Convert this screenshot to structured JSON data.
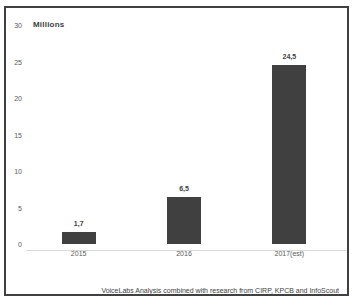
{
  "chart_data": {
    "type": "bar",
    "title": "",
    "ylabel": "Millions",
    "xlabel": "",
    "categories": [
      "2015",
      "2016",
      "2017(est)"
    ],
    "values": [
      1.7,
      6.5,
      24.5
    ],
    "value_labels": [
      "1,7",
      "6,5",
      "24,5"
    ],
    "yticks": [
      0,
      5,
      10,
      15,
      20,
      25,
      30
    ],
    "ylim": [
      0,
      30
    ],
    "grid": false,
    "legend": false,
    "bar_color": "#404040",
    "axis_line_color": "#d9d9d9",
    "caption": "VoiceLabs Analysis combined with research from CIRP, KPCB and InfoScout"
  }
}
